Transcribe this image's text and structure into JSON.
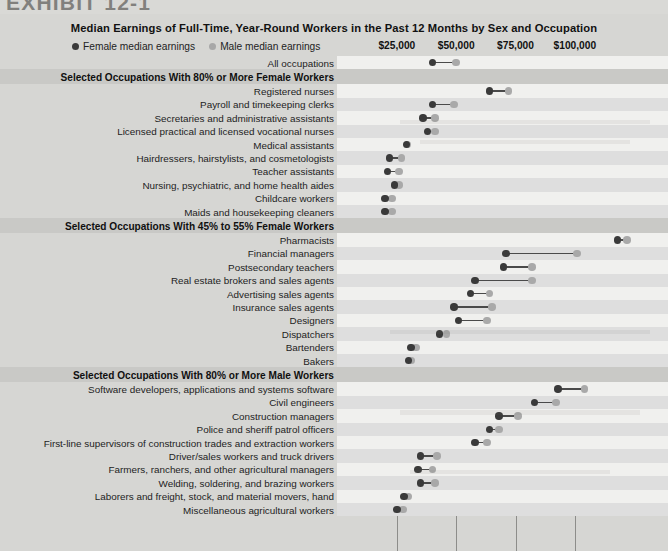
{
  "exhibit_label": "EXHIBIT 12-1",
  "chart": {
    "title": "Median Earnings of Full-Time, Year-Round Workers in the Past 12 Months by Sex and Occupation",
    "legend": [
      {
        "key": "female",
        "label": "Female median earnings",
        "color": "#3a3a3a"
      },
      {
        "key": "male",
        "label": "Male median earnings",
        "color": "#a9a9a9"
      }
    ],
    "axis_ticks": [
      "$25,000",
      "$50,000",
      "$75,000",
      "$100,000"
    ]
  },
  "chart_data": {
    "type": "dot",
    "title": "Median Earnings of Full-Time, Year-Round Workers in the Past 12 Months by Sex and Occupation",
    "xlabel": "",
    "ylabel": "",
    "xlim": [
      0,
      130000
    ],
    "xticks": [
      25000,
      50000,
      75000,
      100000
    ],
    "xtick_labels": [
      "$25,000",
      "$50,000",
      "$75,000",
      "$100,000"
    ],
    "grid": true,
    "legend_position": "top-left",
    "series": [
      {
        "name": "Female median earnings",
        "color": "#3a3a3a"
      },
      {
        "name": "Male median earnings",
        "color": "#a9a9a9"
      }
    ],
    "sections": [
      {
        "header": null,
        "rows": [
          {
            "category": "All occupations",
            "female": 40000,
            "male": 50000
          }
        ]
      },
      {
        "header": "Selected Occupations With 80% or More Female Workers",
        "rows": [
          {
            "category": "Registered nurses",
            "female": 64000,
            "male": 72000
          },
          {
            "category": "Payroll and timekeeping clerks",
            "female": 40000,
            "male": 49000
          },
          {
            "category": "Secretaries and administrative assistants",
            "female": 36000,
            "male": 41000
          },
          {
            "category": "Licensed practical and licensed vocational nurses",
            "female": 38000,
            "male": 41000
          },
          {
            "category": "Medical assistants",
            "female": 29000,
            "male": 29500
          },
          {
            "category": "Hairdressers, hairstylists, and cosmetologists",
            "female": 22000,
            "male": 27000
          },
          {
            "category": "Teacher assistants",
            "female": 21000,
            "male": 26000
          },
          {
            "category": "Nursing, psychiatric, and home health aides",
            "female": 24000,
            "male": 26000
          },
          {
            "category": "Childcare workers",
            "female": 20000,
            "male": 23000
          },
          {
            "category": "Maids and housekeeping cleaners",
            "female": 20000,
            "male": 23000
          }
        ]
      },
      {
        "header": "Selected Occupations With 45% to 55% Female Workers",
        "rows": [
          {
            "category": "Pharmacists",
            "female": 118000,
            "male": 122000
          },
          {
            "category": "Financial managers",
            "female": 71000,
            "male": 101000
          },
          {
            "category": "Postsecondary teachers",
            "female": 70000,
            "male": 82000
          },
          {
            "category": "Real estate brokers and sales agents",
            "female": 58000,
            "male": 82000
          },
          {
            "category": "Advertising sales agents",
            "female": 56000,
            "male": 64000
          },
          {
            "category": "Insurance sales agents",
            "female": 49000,
            "male": 65000
          },
          {
            "category": "Designers",
            "female": 51000,
            "male": 63000
          },
          {
            "category": "Dispatchers",
            "female": 43000,
            "male": 46000
          },
          {
            "category": "Bartenders",
            "female": 31000,
            "male": 33000
          },
          {
            "category": "Bakers",
            "female": 30000,
            "male": 31000
          }
        ]
      },
      {
        "header": "Selected Occupations With 80% or More Male Workers",
        "rows": [
          {
            "category": "Software developers, applications and systems software",
            "female": 93000,
            "male": 104000
          },
          {
            "category": "Civil engineers",
            "female": 83000,
            "male": 92000
          },
          {
            "category": "Construction managers",
            "female": 68000,
            "male": 76000
          },
          {
            "category": "Police and sheriff patrol officers",
            "female": 64000,
            "male": 68000
          },
          {
            "category": "First-line supervisors of construction trades and extraction workers",
            "female": 58000,
            "male": 63000
          },
          {
            "category": "Driver/sales workers and truck drivers",
            "female": 35000,
            "male": 42000
          },
          {
            "category": "Farmers, ranchers, and other agricultural managers",
            "female": 34000,
            "male": 40000
          },
          {
            "category": "Welding, soldering, and brazing workers",
            "female": 35000,
            "male": 41000
          },
          {
            "category": "Laborers and freight, stock, and material movers, hand",
            "female": 28000,
            "male": 30000
          },
          {
            "category": "Miscellaneous agricultural workers",
            "female": 25000,
            "male": 27500
          }
        ]
      }
    ]
  }
}
